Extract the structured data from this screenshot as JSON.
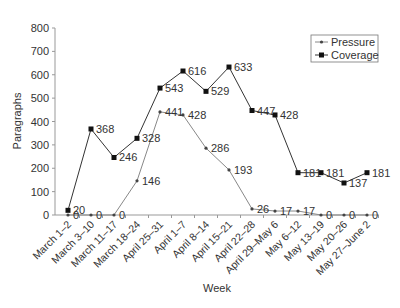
{
  "chart_data": {
    "type": "line",
    "title": "",
    "xlabel": "Week",
    "ylabel": "Paragraphs",
    "ylim": [
      0,
      800
    ],
    "yticks": [
      0,
      100,
      200,
      300,
      400,
      500,
      600,
      700,
      800
    ],
    "grid": false,
    "legend_position": "upper right",
    "categories": [
      "March 1–2",
      "March 3–10",
      "March 11–17",
      "March 18–24",
      "April 25–31",
      "April 1–7",
      "April 8–14",
      "April 15–21",
      "April 22–28",
      "April 29–May 6",
      "May 6–12",
      "May 13–19",
      "May 20–26",
      "May 27–June 2"
    ],
    "series": [
      {
        "name": "Pressure",
        "marker": "small-dot",
        "color": "#888888",
        "values": [
          0,
          0,
          0,
          146,
          441,
          428,
          286,
          193,
          26,
          17,
          17,
          0,
          0,
          0
        ]
      },
      {
        "name": "Coverage",
        "marker": "square",
        "color": "#333333",
        "values": [
          20,
          368,
          246,
          328,
          543,
          616,
          529,
          633,
          447,
          428,
          181,
          181,
          137,
          181
        ]
      }
    ]
  }
}
